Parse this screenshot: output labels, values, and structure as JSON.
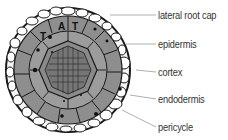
{
  "diagram": {
    "type": "root cross-section",
    "labels": [
      {
        "text": "lateral root cap",
        "y": 15
      },
      {
        "text": "epidermis",
        "y": 44
      },
      {
        "text": "cortex",
        "y": 72
      },
      {
        "text": "endodermis",
        "y": 99
      },
      {
        "text": "pericycle",
        "y": 127
      }
    ],
    "cell_markers": [
      "A",
      "T",
      "T"
    ],
    "colors": {
      "outline": "#1a1a1a",
      "root_cap": "#f4f4f4",
      "epidermis": "#8c8c8c",
      "cortex": "#9a9a9a",
      "stele": "#7a7a7a",
      "leader_line": "#999999",
      "label_text": "#333333"
    }
  }
}
